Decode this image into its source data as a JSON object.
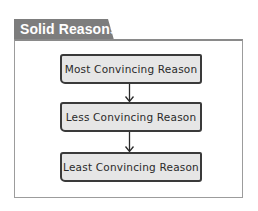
{
  "title": "Solid Reasons",
  "diagram": {
    "type": "flowchart",
    "direction": "top-to-bottom",
    "nodes": [
      {
        "id": "n1",
        "label": "Most Convincing Reason"
      },
      {
        "id": "n2",
        "label": "Less Convincing Reason"
      },
      {
        "id": "n3",
        "label": "Least Convincing Reason"
      }
    ],
    "edges": [
      {
        "from": "n1",
        "to": "n2"
      },
      {
        "from": "n2",
        "to": "n3"
      }
    ]
  },
  "colors": {
    "tab": "#7d7d7d",
    "box_fill": "#e6e6e6",
    "box_stroke": "#3a3a3a",
    "frame": "#9c9c9c"
  }
}
